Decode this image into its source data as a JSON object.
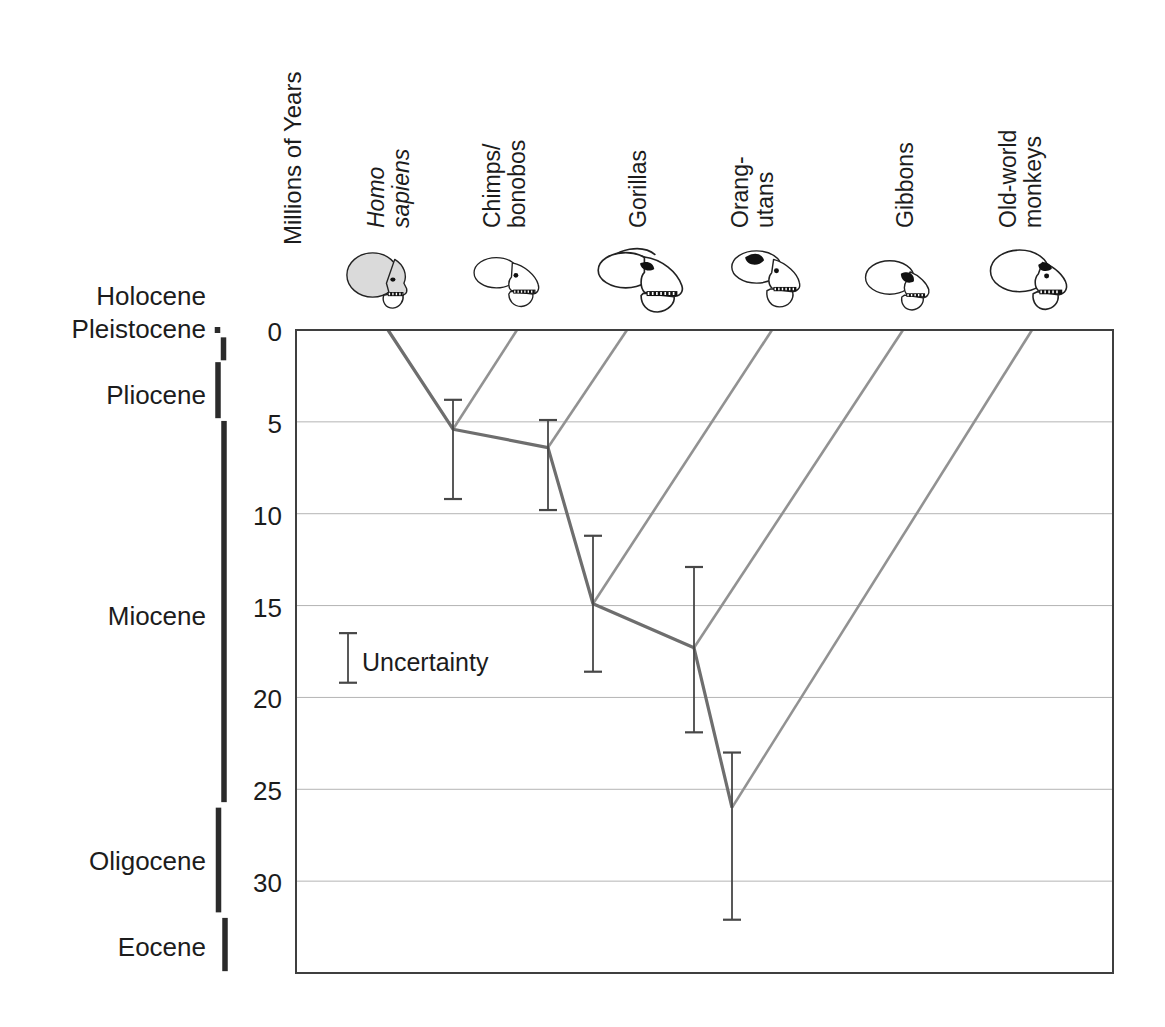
{
  "figure": {
    "y_axis_title": "Millions of Years",
    "legend_label": "Uncertainty"
  },
  "chart_data": {
    "type": "line",
    "subtype": "phylogenetic-timetree",
    "title": "",
    "ylabel": "Millions of Years",
    "ylim": [
      0,
      35
    ],
    "yticks": [
      0,
      5,
      10,
      15,
      20,
      25,
      30
    ],
    "grid": true,
    "legend_position": "middle-left",
    "taxa": [
      {
        "id": "homo-sapiens",
        "name": "Homo sapiens",
        "label_lines": [
          "Homo",
          "sapiens"
        ],
        "italic": true,
        "icon": "homo-sapiens-skull-icon"
      },
      {
        "id": "chimps-bonobos",
        "name": "Chimps/bonobos",
        "label_lines": [
          "Chimps/",
          "bonobos"
        ],
        "italic": false,
        "icon": "chimps-bonobos-skull-icon"
      },
      {
        "id": "gorillas",
        "name": "Gorillas",
        "label_lines": [
          "Gorillas"
        ],
        "italic": false,
        "icon": "gorillas-skull-icon"
      },
      {
        "id": "orang-utans",
        "name": "Orang-utans",
        "label_lines": [
          "Orang-",
          "utans"
        ],
        "italic": false,
        "icon": "orang-utans-skull-icon"
      },
      {
        "id": "gibbons",
        "name": "Gibbons",
        "label_lines": [
          "Gibbons"
        ],
        "italic": false,
        "icon": "gibbons-skull-icon"
      },
      {
        "id": "old-world-monkeys",
        "name": "Old-world monkeys",
        "label_lines": [
          "Old-world",
          "monkeys"
        ],
        "italic": false,
        "icon": "old-world-monkeys-skull-icon"
      }
    ],
    "divergences": [
      {
        "joining_taxon": "Chimps/bonobos",
        "estimate_mya": 5.4,
        "ci_mya": [
          3.8,
          9.2
        ]
      },
      {
        "joining_taxon": "Gorillas",
        "estimate_mya": 6.4,
        "ci_mya": [
          4.9,
          9.8
        ]
      },
      {
        "joining_taxon": "Orang-utans",
        "estimate_mya": 14.9,
        "ci_mya": [
          11.2,
          18.6
        ]
      },
      {
        "joining_taxon": "Gibbons",
        "estimate_mya": 17.3,
        "ci_mya": [
          12.9,
          21.9
        ]
      },
      {
        "joining_taxon": "Old-world monkeys",
        "estimate_mya": 26.0,
        "ci_mya": [
          23.0,
          32.1
        ]
      }
    ],
    "epochs": [
      {
        "name": "Holocene",
        "from_mya": 0.0,
        "to_mya": 0.25
      },
      {
        "name": "Pleistocene",
        "from_mya": 0.4,
        "to_mya": 1.65
      },
      {
        "name": "Pliocene",
        "from_mya": 1.75,
        "to_mya": 4.8
      },
      {
        "name": "Miocene",
        "from_mya": 4.95,
        "to_mya": 25.7
      },
      {
        "name": "Oligocene",
        "from_mya": 26.0,
        "to_mya": 31.7
      },
      {
        "name": "Eocene",
        "from_mya": 32.0,
        "to_mya": 34.9
      }
    ],
    "legend": {
      "label": "Uncertainty",
      "ci_mya": [
        16.5,
        19.2
      ]
    },
    "colors": {
      "trunk": "#6e6e6e",
      "branch": "#929292",
      "error_bar": "#474747",
      "gridline": "#b4b4b4",
      "frame": "#3f3f3f",
      "epoch_bar": "#2b2b2b",
      "text": "#1c1c1c",
      "homo_skull_fill": "#dadada",
      "skull_line": "#222222"
    },
    "layout": {
      "plot_px": {
        "left": 296,
        "top": 330,
        "right": 1113,
        "bottom": 973
      },
      "taxa_tip_x_px": [
        388,
        517,
        627,
        772,
        903,
        1032
      ],
      "taxa_label_x_px": [
        389,
        505,
        638,
        753,
        905,
        1021
      ],
      "taxa_label_bottom_px": 228,
      "taxa_line_height_px": 25,
      "node_x_px": [
        453,
        548,
        593,
        694,
        732
      ],
      "legend_bar_x_px": 348,
      "errorbar_cap_halfwidth_px": 9,
      "tick_label_right_px": 282,
      "epoch_label_right_px": 206,
      "epoch_bar_x_px": [
        217.5,
        223.5,
        218,
        224,
        218.5,
        225
      ],
      "epoch_bar_nudge_px": [
        -3,
        0,
        0,
        0,
        0,
        0
      ],
      "epoch_label_y_px": [
        296,
        329,
        395,
        616,
        861,
        947
      ],
      "skull_px": [
        {
          "cx": 380,
          "top": 252,
          "s": 0.92,
          "shape": "human"
        },
        {
          "cx": 507,
          "top": 254,
          "s": 0.89,
          "shape": "ape"
        },
        {
          "cx": 640,
          "top": 246,
          "s": 1.1,
          "shape": "gorilla"
        },
        {
          "cx": 766,
          "top": 248,
          "s": 0.95,
          "shape": "orang"
        },
        {
          "cx": 899,
          "top": 257,
          "s": 0.93,
          "shape": "gibbon"
        },
        {
          "cx": 1030,
          "top": 248,
          "s": 1.04,
          "shape": "owm"
        }
      ]
    }
  }
}
